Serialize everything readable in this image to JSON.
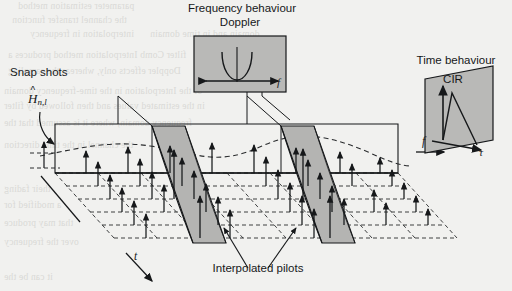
{
  "figure": {
    "kind": "3d-time-frequency-channel-estimation-grid",
    "paper_color": "#f1f1ef",
    "ink_color": "#16181a",
    "panel_fill": "#b9b9b7",
    "slice_fill": "#b4b4b2",
    "labels": {
      "freq_behaviour": "Frequency behaviour",
      "doppler": "Doppler",
      "time_behaviour": "Time behaviour",
      "cir": "CIR",
      "snap_shots": "Snap shots",
      "interpolated_pilots": "Interpolated pilots",
      "h_estimate_symbol": "H",
      "h_estimate_sub": "n,l",
      "axis_t": "t",
      "axis_f_main": "f",
      "axis_f_doppler": "f",
      "axis_tau": "τ"
    }
  },
  "doppler_panel": {
    "title_line1": "Frequency behaviour",
    "title_line2": "Doppler",
    "axis_label": "f",
    "shape": "u-shaped-jakes-spectrum"
  },
  "cir_panel": {
    "title": "Time behaviour",
    "subtitle": "CIR",
    "axis_label": "τ",
    "shape": "decaying-impulse-response"
  },
  "grid": {
    "time_axis_label": "t",
    "freq_axis_label": "f",
    "estimate_label_symbol": "H",
    "estimate_label_subscript": "n,l",
    "snapshot_label": "Snap shots",
    "pilot_label": "Interpolated pilots",
    "rows": 6,
    "columns": 8,
    "slice_count": 2,
    "envelope": "dashed-sinusoidal-fading-envelope"
  },
  "bleed_text": [
    "parameter estimation method",
    "the channel transfer function",
    "interpolation in frequency",
    "domain and in time domain",
    "filter Comb Interpolation method produces a",
    "Doppler effects only, whereas the sampling",
    "of the Interpolation in the time-frequency domain",
    "in the estimated values and then followed by filter",
    "frequency domain, where it is assumed that the",
    "the channel in the time direction",
    "their fading",
    "a modified for",
    "that may produce",
    "over the frequency",
    "it can be the"
  ]
}
